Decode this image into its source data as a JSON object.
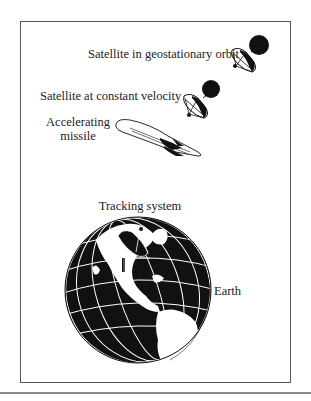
{
  "diagram": {
    "labels": {
      "geo_satellite": "Satellite in geostationary orbit",
      "const_satellite": "Satellite at constant velocity",
      "missile_line1": "Accelerating",
      "missile_line2": "missile",
      "tracking": "Tracking system",
      "earth": "Earth"
    },
    "elements": [
      {
        "id": "geo-satellite",
        "icon": "satellite-icon"
      },
      {
        "id": "const-satellite",
        "icon": "satellite-icon"
      },
      {
        "id": "missile",
        "icon": "missile-icon"
      },
      {
        "id": "earth",
        "icon": "globe-icon"
      },
      {
        "id": "tracking-dish",
        "icon": "radar-dish-icon"
      }
    ],
    "colors": {
      "ink": "#111111",
      "frame": "#555555",
      "rule": "#8a8a8a",
      "background": "#ffffff"
    }
  }
}
